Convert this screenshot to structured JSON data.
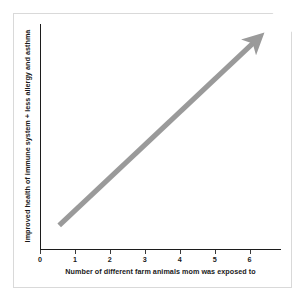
{
  "figure": {
    "frame_color": "#d9d9d9",
    "background": "#ffffff"
  },
  "chart_data": {
    "type": "line",
    "title": "",
    "subtitle": "",
    "xlabel": "Number of different farm animals mom was exposed to",
    "ylabel": "Improved health of immune system + less allergy and asthma",
    "xticks": [
      "0",
      "1",
      "2",
      "3",
      "4",
      "5",
      "6"
    ],
    "xtick_values": [
      0,
      1,
      2,
      3,
      4,
      5,
      6
    ],
    "yticks": [],
    "xlim": [
      0,
      6.9
    ],
    "ylim": [
      0,
      1
    ],
    "grid": false,
    "legend": null,
    "series": [
      {
        "name": "trend-arrow",
        "style": "thick-gray-arrow",
        "color": "#9a9a9a",
        "x": [
          0.55,
          6.1
        ],
        "y": [
          0.105,
          0.915
        ],
        "annotation": "Upward trend arrow indicating positive correlation"
      }
    ],
    "annotations": [
      {
        "type": "arrow",
        "direction": "up-right",
        "color": "#9a9a9a"
      }
    ]
  },
  "icons": {
    "arrow": "arrow-up-right-icon"
  }
}
